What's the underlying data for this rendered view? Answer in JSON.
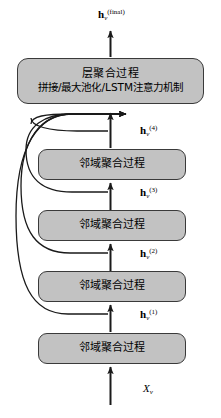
{
  "diagram": {
    "type": "flow-diagram",
    "canvas": {
      "width": 221,
      "height": 418
    },
    "colors": {
      "box_fill": "#c2c2c2",
      "box_border": "#3a3a3a",
      "stroke": "#1a1a1a",
      "background": "#ffffff"
    }
  },
  "boxes": {
    "layer_aggregation": {
      "line1": "层聚合过程",
      "line2": "拼接/最大池化/LSTM注意力机制"
    },
    "neighbor_aggregation_label": "邻域聚合过程",
    "neighbor_layers": [
      {
        "id": 1,
        "label": "邻域聚合过程"
      },
      {
        "id": 2,
        "label": "邻域聚合过程"
      },
      {
        "id": 3,
        "label": "邻域聚合过程"
      },
      {
        "id": 4,
        "label": "邻域聚合过程"
      }
    ]
  },
  "labels": {
    "output": {
      "base": "h",
      "sub": "v",
      "sup": "(final)"
    },
    "h4": {
      "base": "h",
      "sub": "v",
      "sup": "(4)"
    },
    "h3": {
      "base": "h",
      "sub": "v",
      "sup": "(3)"
    },
    "h2": {
      "base": "h",
      "sub": "v",
      "sup": "(2)"
    },
    "h1": {
      "base": "h",
      "sub": "v",
      "sup": "(1)"
    },
    "input": {
      "base": "X",
      "sub": "v",
      "sup": ""
    }
  }
}
